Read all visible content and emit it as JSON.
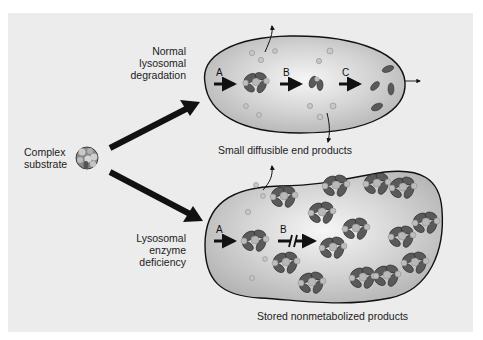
{
  "diagram": {
    "colors": {
      "background_panel": "#ececec",
      "lysosome_fill": "#c9c9c9",
      "lysosome_highlight": "#f4f4f4",
      "outline": "#111111",
      "substrate_dark": "#555555",
      "substrate_light": "#b5b5b5"
    },
    "substrate": {
      "label_line1": "Complex",
      "label_line2": "substrate"
    },
    "normal": {
      "label_line1": "Normal",
      "label_line2": "lysosomal",
      "label_line3": "degradation",
      "steps": [
        "A",
        "B",
        "C"
      ],
      "caption": "Small diffusible end products"
    },
    "deficient": {
      "label_line1": "Lysosomal",
      "label_line2": "enzyme",
      "label_line3": "deficiency",
      "steps": [
        "A",
        "B"
      ],
      "blocked_step": "B",
      "caption": "Stored nonmetabolized products"
    }
  }
}
